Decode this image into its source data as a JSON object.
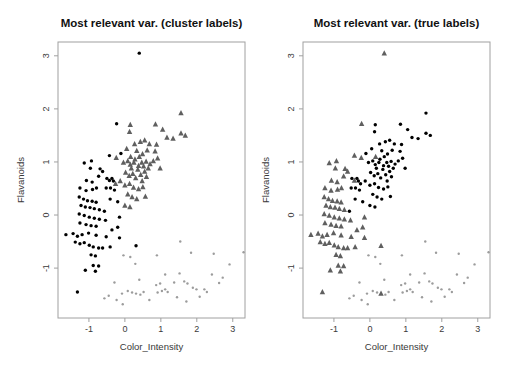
{
  "figure": {
    "background": "#ffffff",
    "kind": "R base-graphics scatterplot pair, same data with two labelings"
  },
  "panels": [
    {
      "title": "Most relevant var. (cluster labels)",
      "xlabel": "Color_Intensity",
      "ylabel": "Flavanoids",
      "label_field": "cluster_label"
    },
    {
      "title": "Most relevant var. (true labels)",
      "xlabel": "Color_Intensity",
      "ylabel": "Flavanoids",
      "label_field": "true_label"
    }
  ],
  "chart_data": {
    "type": "scatter",
    "title_left": "Most relevant var. (cluster labels)",
    "title_right": "Most relevant var. (true labels)",
    "xlabel": "Color_Intensity",
    "ylabel": "Flavanoids",
    "xlim": [
      -1.86,
      3.34
    ],
    "ylim": [
      -1.94,
      3.26
    ],
    "xticks": [
      -1,
      0,
      1,
      2,
      3
    ],
    "yticks": [
      -1,
      0,
      1,
      2,
      3
    ],
    "grid": false,
    "legend": "none",
    "axis_color": "#a0a0a0",
    "tick_label_color": "#3a3a3a",
    "classes": {
      "1": {
        "name": "class-1",
        "marker": "circle",
        "color": "#000000",
        "size": 1.7
      },
      "2": {
        "name": "class-2",
        "marker": "triangle",
        "color": "#5f5f5f",
        "size": 3.0
      },
      "3": {
        "name": "class-3",
        "marker": "circle",
        "color": "#9c9c9c",
        "size": 1.2
      }
    },
    "points_format": [
      "x",
      "y",
      "cluster_label",
      "true_label"
    ],
    "points": [
      [
        0.4,
        3.05,
        1,
        2
      ],
      [
        -0.23,
        1.72,
        1,
        2
      ],
      [
        0.15,
        1.7,
        2,
        1
      ],
      [
        0.13,
        1.57,
        2,
        1
      ],
      [
        0.85,
        1.71,
        2,
        1
      ],
      [
        1.05,
        1.61,
        2,
        1
      ],
      [
        1.56,
        1.92,
        2,
        1
      ],
      [
        1.56,
        1.54,
        2,
        1
      ],
      [
        1.68,
        1.5,
        2,
        1
      ],
      [
        1.17,
        1.46,
        2,
        1
      ],
      [
        1.34,
        1.44,
        2,
        1
      ],
      [
        0.27,
        1.34,
        2,
        1
      ],
      [
        0.43,
        1.38,
        2,
        1
      ],
      [
        0.55,
        1.41,
        2,
        1
      ],
      [
        0.68,
        1.34,
        2,
        1
      ],
      [
        0.88,
        1.33,
        2,
        1
      ],
      [
        -0.43,
        1.12,
        1,
        2
      ],
      [
        -0.11,
        1.16,
        1,
        1
      ],
      [
        -0.24,
        1.08,
        2,
        2
      ],
      [
        0.16,
        1.1,
        2,
        2
      ],
      [
        -0.04,
        0.99,
        2,
        1
      ],
      [
        0.08,
        1.02,
        2,
        1
      ],
      [
        0.15,
        0.95,
        2,
        1
      ],
      [
        0.25,
        0.99,
        2,
        1
      ],
      [
        0.38,
        0.93,
        2,
        1
      ],
      [
        0.47,
        0.99,
        2,
        1
      ],
      [
        0.59,
        1.01,
        2,
        1
      ],
      [
        0.7,
        0.96,
        2,
        1
      ],
      [
        0.79,
        1.02,
        2,
        1
      ],
      [
        0.84,
        1.2,
        2,
        1
      ],
      [
        0.91,
        1.07,
        2,
        1
      ],
      [
        0.98,
        0.88,
        2,
        1
      ],
      [
        0.33,
        1.21,
        2,
        1
      ],
      [
        0.05,
        1.25,
        2,
        1
      ],
      [
        0.49,
        1.15,
        2,
        1
      ],
      [
        0.62,
        1.22,
        2,
        1
      ],
      [
        0.02,
        0.8,
        2,
        1
      ],
      [
        0.12,
        0.74,
        2,
        1
      ],
      [
        0.22,
        0.78,
        2,
        1
      ],
      [
        0.3,
        0.7,
        2,
        1
      ],
      [
        0.44,
        0.76,
        2,
        1
      ],
      [
        0.55,
        0.82,
        2,
        1
      ],
      [
        0.36,
        0.86,
        2,
        1
      ],
      [
        0.18,
        0.88,
        2,
        1
      ],
      [
        0.48,
        0.64,
        2,
        1
      ],
      [
        0.6,
        0.72,
        2,
        1
      ],
      [
        0.28,
        1.05,
        2,
        1
      ],
      [
        0.4,
        1.1,
        2,
        1
      ],
      [
        0.52,
        0.92,
        2,
        1
      ],
      [
        0.65,
        0.88,
        2,
        1
      ],
      [
        -1.13,
        0.98,
        1,
        2
      ],
      [
        -0.93,
        1.02,
        1,
        2
      ],
      [
        -0.96,
        0.88,
        1,
        2
      ],
      [
        -0.69,
        0.87,
        1,
        2
      ],
      [
        -0.62,
        0.82,
        1,
        2
      ],
      [
        -0.73,
        0.73,
        1,
        2
      ],
      [
        -0.5,
        0.69,
        1,
        1
      ],
      [
        -0.36,
        0.69,
        1,
        1
      ],
      [
        -1.07,
        0.65,
        1,
        2
      ],
      [
        -0.91,
        0.62,
        1,
        2
      ],
      [
        -0.43,
        0.65,
        1,
        2
      ],
      [
        -0.32,
        0.64,
        1,
        1
      ],
      [
        -0.26,
        0.59,
        2,
        1
      ],
      [
        -0.13,
        0.64,
        2,
        1
      ],
      [
        0.0,
        0.56,
        2,
        1
      ],
      [
        0.13,
        0.59,
        2,
        1
      ],
      [
        0.24,
        0.52,
        2,
        1
      ],
      [
        0.38,
        0.49,
        2,
        1
      ],
      [
        0.5,
        0.53,
        2,
        1
      ],
      [
        0.57,
        0.35,
        2,
        1
      ],
      [
        -1.25,
        0.51,
        1,
        2
      ],
      [
        -1.08,
        0.46,
        1,
        2
      ],
      [
        -0.9,
        0.48,
        1,
        2
      ],
      [
        -0.79,
        0.51,
        1,
        2
      ],
      [
        -0.52,
        0.51,
        1,
        1
      ],
      [
        -0.4,
        0.51,
        1,
        1
      ],
      [
        -0.29,
        0.47,
        1,
        1
      ],
      [
        -1.27,
        0.34,
        1,
        2
      ],
      [
        -1.15,
        0.3,
        1,
        2
      ],
      [
        -1.04,
        0.27,
        1,
        2
      ],
      [
        -0.91,
        0.26,
        1,
        2
      ],
      [
        -0.8,
        0.24,
        1,
        2
      ],
      [
        -1.22,
        0.18,
        1,
        2
      ],
      [
        -1.1,
        0.15,
        1,
        2
      ],
      [
        -0.97,
        0.14,
        1,
        2
      ],
      [
        -0.85,
        0.12,
        1,
        2
      ],
      [
        -0.71,
        0.1,
        1,
        2
      ],
      [
        -0.57,
        0.07,
        1,
        1
      ],
      [
        0.0,
        0.18,
        2,
        1
      ],
      [
        0.14,
        0.15,
        2,
        1
      ],
      [
        0.08,
        0.39,
        2,
        1
      ],
      [
        0.2,
        0.34,
        2,
        1
      ],
      [
        0.33,
        0.3,
        2,
        1
      ],
      [
        -0.41,
        0.3,
        1,
        1
      ],
      [
        -0.2,
        0.25,
        1,
        1
      ],
      [
        -1.27,
        0.02,
        1,
        2
      ],
      [
        -1.13,
        -0.01,
        1,
        2
      ],
      [
        -0.99,
        -0.04,
        1,
        2
      ],
      [
        -0.85,
        -0.06,
        1,
        2
      ],
      [
        -0.71,
        -0.08,
        1,
        2
      ],
      [
        -0.54,
        -0.1,
        1,
        2
      ],
      [
        -1.25,
        -0.15,
        1,
        2
      ],
      [
        -1.08,
        -0.18,
        1,
        2
      ],
      [
        -0.94,
        -0.2,
        1,
        2
      ],
      [
        -0.8,
        -0.21,
        1,
        2
      ],
      [
        -0.15,
        -0.04,
        1,
        2
      ],
      [
        -0.2,
        -0.23,
        1,
        2
      ],
      [
        -0.36,
        -0.28,
        1,
        2
      ],
      [
        -1.64,
        -0.37,
        1,
        2
      ],
      [
        -1.44,
        -0.35,
        1,
        2
      ],
      [
        -1.32,
        -0.4,
        1,
        2
      ],
      [
        -1.19,
        -0.37,
        1,
        2
      ],
      [
        -1.01,
        -0.34,
        1,
        2
      ],
      [
        -0.8,
        -0.38,
        1,
        2
      ],
      [
        -0.52,
        -0.41,
        1,
        2
      ],
      [
        -0.15,
        -0.43,
        1,
        2
      ],
      [
        0.31,
        -0.58,
        1,
        2
      ],
      [
        -1.38,
        -0.51,
        1,
        2
      ],
      [
        -1.25,
        -0.54,
        1,
        2
      ],
      [
        -1.13,
        -0.52,
        1,
        2
      ],
      [
        -0.99,
        -0.57,
        1,
        2
      ],
      [
        -0.88,
        -0.6,
        1,
        2
      ],
      [
        -0.73,
        -0.62,
        1,
        2
      ],
      [
        -0.62,
        -0.62,
        1,
        2
      ],
      [
        -0.41,
        -0.6,
        1,
        2
      ],
      [
        -0.94,
        -0.75,
        1,
        2
      ],
      [
        -0.82,
        -0.77,
        1,
        2
      ],
      [
        -0.88,
        -0.95,
        1,
        2
      ],
      [
        -0.73,
        -0.96,
        1,
        2
      ],
      [
        -1.1,
        -1.04,
        1,
        2
      ],
      [
        -0.82,
        -1.06,
        1,
        2
      ],
      [
        -1.32,
        -1.45,
        1,
        2
      ],
      [
        -0.04,
        -0.76,
        3,
        3
      ],
      [
        0.15,
        -0.79,
        3,
        3
      ],
      [
        0.29,
        -0.92,
        3,
        3
      ],
      [
        -0.29,
        -1.27,
        3,
        3
      ],
      [
        -0.45,
        -1.52,
        3,
        3
      ],
      [
        -0.57,
        -1.57,
        3,
        3
      ],
      [
        -0.23,
        -1.6,
        3,
        3
      ],
      [
        -0.06,
        -1.68,
        3,
        3
      ],
      [
        -0.08,
        -1.48,
        3,
        3
      ],
      [
        0.08,
        -1.43,
        3,
        3
      ],
      [
        0.2,
        -1.46,
        3,
        3
      ],
      [
        0.31,
        -1.48,
        3,
        2
      ],
      [
        0.43,
        -1.5,
        3,
        3
      ],
      [
        0.52,
        -1.45,
        3,
        3
      ],
      [
        0.68,
        -1.6,
        3,
        3
      ],
      [
        0.4,
        -1.22,
        3,
        3
      ],
      [
        1.54,
        -0.5,
        3,
        3
      ],
      [
        1.84,
        -0.71,
        3,
        3
      ],
      [
        0.89,
        -0.76,
        3,
        3
      ],
      [
        2.47,
        -0.73,
        3,
        3
      ],
      [
        3.3,
        -0.7,
        3,
        3
      ],
      [
        2.91,
        -0.93,
        3,
        3
      ],
      [
        1.12,
        -1.12,
        3,
        3
      ],
      [
        1.52,
        -1.1,
        3,
        3
      ],
      [
        2.42,
        -1.12,
        3,
        3
      ],
      [
        0.98,
        -1.29,
        3,
        3
      ],
      [
        0.87,
        -1.32,
        3,
        3
      ],
      [
        1.37,
        -1.27,
        3,
        3
      ],
      [
        1.65,
        -1.25,
        3,
        3
      ],
      [
        1.74,
        -1.29,
        3,
        3
      ],
      [
        1.12,
        -1.4,
        3,
        3
      ],
      [
        1.03,
        -1.43,
        3,
        3
      ],
      [
        1.19,
        -1.45,
        3,
        3
      ],
      [
        0.91,
        -1.46,
        3,
        3
      ],
      [
        1.89,
        -1.37,
        3,
        3
      ],
      [
        1.99,
        -1.4,
        3,
        3
      ],
      [
        2.21,
        -1.4,
        3,
        3
      ],
      [
        2.28,
        -1.45,
        3,
        3
      ],
      [
        2.08,
        -1.54,
        3,
        3
      ],
      [
        1.71,
        -1.63,
        3,
        3
      ],
      [
        2.62,
        -1.28,
        3,
        3
      ],
      [
        2.72,
        -1.18,
        3,
        3
      ],
      [
        1.45,
        -1.55,
        3,
        3
      ]
    ]
  }
}
